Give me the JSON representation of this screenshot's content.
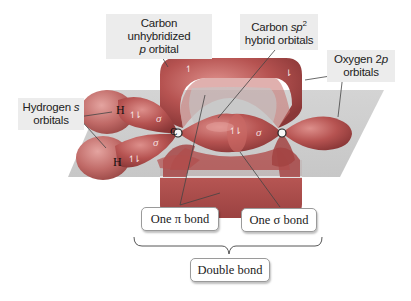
{
  "labels": {
    "carbon_p": {
      "line1": "Carbon unhybridized",
      "line2_italic": "p",
      "line2_rest": " orbital"
    },
    "carbon_sp2": {
      "line1_pre": "Carbon ",
      "line1_italic": "sp",
      "line1_sup": "2",
      "line2": "hybrid orbitals"
    },
    "oxygen_2p": {
      "line1_pre": "Oxygen 2",
      "line1_italic": "p",
      "line2": "orbitals"
    },
    "hydrogen_s": {
      "line1_pre": "Hydrogen ",
      "line1_italic": "s",
      "line2": "orbitals"
    }
  },
  "atoms": {
    "h_top": "H",
    "h_bottom": "H",
    "carbon": "C",
    "oxygen": "O"
  },
  "bond_symbols": {
    "sigma": "σ",
    "pi": "π",
    "spin_pair": "↿⇂",
    "spin_up": "↿",
    "spin_down": "⇂"
  },
  "boxes": {
    "pi_bond": "One π bond",
    "sigma_bond": "One σ bond",
    "double_bond": "Double bond"
  },
  "colors": {
    "orbital": "#b5504f",
    "orbital_dark": "#8e3a3a",
    "orbital_light": "#d88a86",
    "plane": "#c9c9c9",
    "label_bg": "#ececec"
  }
}
